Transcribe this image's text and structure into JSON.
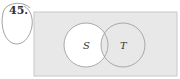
{
  "problem": {
    "number": "45."
  },
  "venn": {
    "sets": [
      {
        "label": "S",
        "cx": 86,
        "cy": 45,
        "r": 22,
        "fill": "#ffffff"
      },
      {
        "label": "T",
        "cx": 123,
        "cy": 45,
        "r": 22,
        "fill": "#e6e6e6"
      }
    ],
    "universe": {
      "x": 34,
      "y": 12,
      "width": 143,
      "height": 64,
      "fill": "#e8e8e8",
      "stroke": "#c8c8c8"
    },
    "shaded": "complement of (S minus T)",
    "colors": {
      "shade": "#e6e6e6",
      "circle_stroke": "#a0a0a0",
      "text": "#333333"
    }
  }
}
